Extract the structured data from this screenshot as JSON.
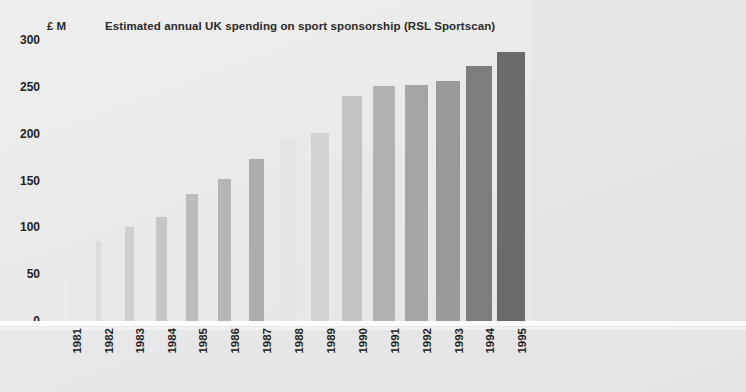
{
  "unit_label": "£ M",
  "chart_data": {
    "type": "bar",
    "title": "Estimated annual UK spending on sport sponsorship (RSL Sportscan)",
    "xlabel": "",
    "ylabel": "£ M",
    "ylim": [
      0,
      300
    ],
    "yticks": [
      0,
      50,
      100,
      150,
      200,
      250,
      300
    ],
    "ytick_labels": [
      "0",
      "50",
      "100",
      "150",
      "200",
      "250",
      "300"
    ],
    "grid": false,
    "legend": "none",
    "categories": [
      "1981",
      "1982",
      "1983",
      "1984",
      "1985",
      "1986",
      "1987",
      "1988",
      "1989",
      "1990",
      "1991",
      "1992",
      "1993",
      "1994",
      "1995"
    ],
    "values": [
      46,
      85,
      100,
      111,
      136,
      152,
      173,
      194,
      201,
      240,
      251,
      252,
      256,
      272,
      287
    ],
    "bar_colors": [
      "#ececec",
      "#dcdcdc",
      "#cfcfcf",
      "#c6c6c6",
      "#bdbdbd",
      "#b5b5b5",
      "#adadad",
      "#e4e4e4",
      "#d2d2d2",
      "#c2c2c2",
      "#b2b2b2",
      "#a5a5a5",
      "#9a9a9a",
      "#7d7d7d",
      "#6b6b6b"
    ],
    "bar_widths": [
      4,
      5,
      9,
      11,
      12,
      13,
      15,
      17,
      18,
      20,
      22,
      23,
      24,
      26,
      28
    ],
    "bar_centers": [
      66,
      98,
      129,
      161,
      192,
      224,
      256,
      288,
      320,
      352,
      384,
      416,
      448,
      479,
      511
    ]
  }
}
